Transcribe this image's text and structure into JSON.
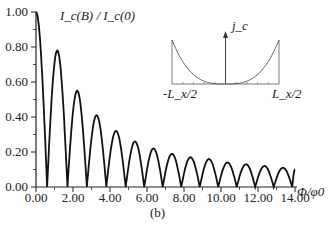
{
  "chart_data": {
    "type": "line",
    "title": "",
    "ylabel": "I_c(B) / I_c(0)",
    "xlabel": "Φ/φ0",
    "caption": "(b)",
    "xlim": [
      0,
      14
    ],
    "ylim": [
      0,
      1
    ],
    "x_ticks": [
      "0.00",
      "2.00",
      "4.00",
      "6.00",
      "8.00",
      "10.00",
      "12.00",
      "14.00"
    ],
    "y_ticks": [
      "0.00",
      "0.20",
      "0.40",
      "0.60",
      "0.80",
      "1.00"
    ],
    "grid": false,
    "series": [
      {
        "name": "Ic(B)/Ic(0)",
        "description": "Fraunhofer-like lobes with slowly decaying peaks",
        "zeros_x": [
          0.6,
          1.7,
          2.75,
          3.8,
          4.85,
          5.85,
          6.85,
          7.85,
          8.85,
          9.85,
          10.85,
          11.85,
          12.85,
          13.85
        ],
        "peak_x": [
          0.0,
          1.15,
          2.2,
          3.25,
          4.3,
          5.35,
          6.35,
          7.35,
          8.35,
          9.35,
          10.35,
          11.35,
          12.35,
          13.35,
          14.0
        ],
        "peak_y": [
          1.0,
          0.78,
          0.55,
          0.41,
          0.32,
          0.26,
          0.22,
          0.19,
          0.17,
          0.16,
          0.14,
          0.13,
          0.12,
          0.11,
          0.1
        ]
      }
    ],
    "inset": {
      "type": "line",
      "ylabel": "j_c",
      "x_ticks": [
        "-L_x/2",
        "L_x/2"
      ],
      "description": "U-shaped current density, high at edges, near zero in center"
    }
  }
}
